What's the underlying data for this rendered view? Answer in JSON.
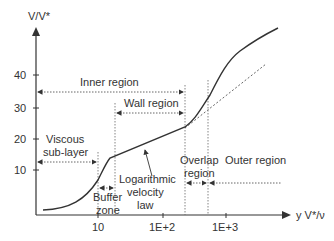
{
  "diagram": {
    "y_axis": {
      "label": "V/V*",
      "ticks": [
        {
          "label": "40",
          "y": 75
        },
        {
          "label": "30",
          "y": 108
        },
        {
          "label": "20",
          "y": 139
        },
        {
          "label": "10",
          "y": 170
        }
      ]
    },
    "x_axis": {
      "label": "y V*/ν",
      "ticks": [
        {
          "label": "10",
          "x": 98
        },
        {
          "label": "1E+2",
          "x": 163
        },
        {
          "label": "1E+3",
          "x": 226
        }
      ]
    },
    "regions": {
      "inner": "Inner region",
      "wall": "Wall region",
      "viscous_1": "Viscous",
      "viscous_2": "sub-layer",
      "buffer_1": "Buffer",
      "buffer_2": "zone",
      "log_1": "Logarithmic",
      "log_2": "velocity",
      "log_3": "law",
      "overlap_1": "Overlap",
      "overlap_2": "region",
      "outer": "Outer region"
    },
    "colors": {
      "line": "#333333",
      "dotted": "#555555"
    }
  }
}
